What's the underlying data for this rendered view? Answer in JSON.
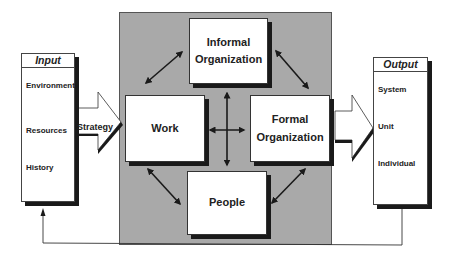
{
  "diagram": {
    "type": "congruence-model",
    "input": {
      "title": "Input",
      "items": [
        "Environment",
        "Resources",
        "History"
      ]
    },
    "strategy_label": "Strategy",
    "transformation": {
      "informal_organization": "Informal Organization",
      "work": "Work",
      "formal_organization": "Formal Organization",
      "people": "People"
    },
    "output": {
      "title": "Output",
      "items": [
        "System",
        "Unit",
        "Individual"
      ]
    },
    "colors": {
      "transformation_background": "#a9a9a9",
      "box_fill": "#ffffff",
      "shadow": "#1a1a1a",
      "line": "#222222"
    }
  }
}
